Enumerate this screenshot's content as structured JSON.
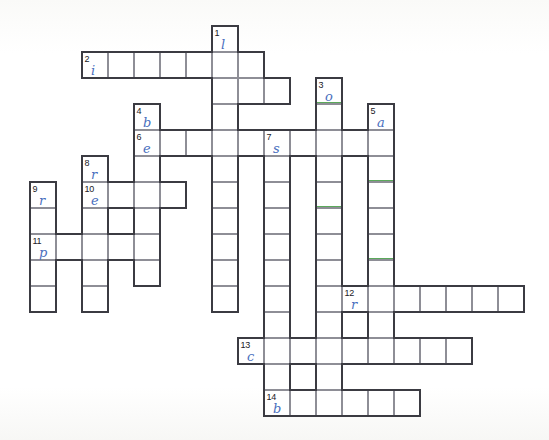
{
  "puzzle": {
    "title": "Crossword Puzzle Grid",
    "cell_size": 26,
    "origin_x": 30,
    "origin_y": 26,
    "ink_color": "#4a6fbe",
    "grid_line_color": "#8e8e96",
    "outline_color": "#3b3b42",
    "mark_color": "#5ba95b",
    "background": "#ffffff"
  },
  "entries": [
    {
      "number": "1",
      "direction": "down",
      "row": 0,
      "col": 7,
      "length": 10,
      "letter": "l"
    },
    {
      "number": "2",
      "direction": "across",
      "row": 1,
      "col": 2,
      "length": 7,
      "letter": "i"
    },
    {
      "number": "3",
      "direction": "down",
      "row": 2,
      "col": 11,
      "length": 8,
      "letter": "o"
    },
    {
      "number": "4",
      "direction": "down",
      "row": 3,
      "col": 4,
      "length": 5,
      "letter": "b"
    },
    {
      "number": "5",
      "direction": "down",
      "row": 3,
      "col": 13,
      "length": 7,
      "letter": "a"
    },
    {
      "number": "6",
      "direction": "across",
      "row": 4,
      "col": 4,
      "length": 10,
      "letter": "e"
    },
    {
      "number": "7",
      "direction": "down",
      "row": 4,
      "col": 9,
      "length": 11,
      "letter": "s"
    },
    {
      "number": "8",
      "direction": "down",
      "row": 5,
      "col": 2,
      "length": 5,
      "letter": "r"
    },
    {
      "number": "9",
      "direction": "down",
      "row": 6,
      "col": 0,
      "length": 5,
      "letter": "r"
    },
    {
      "number": "10",
      "direction": "across",
      "row": 6,
      "col": 2,
      "length": 4,
      "letter": "e"
    },
    {
      "number": "11",
      "direction": "across",
      "row": 8,
      "col": 0,
      "length": 4,
      "letter": "p"
    },
    {
      "number": "12",
      "direction": "across",
      "row": 10,
      "col": 12,
      "length": 7,
      "letter": "r"
    },
    {
      "number": "13",
      "direction": "across",
      "row": 12,
      "col": 8,
      "length": 9,
      "letter": "c"
    },
    {
      "number": "14",
      "direction": "across",
      "row": 14,
      "col": 9,
      "length": 6,
      "letter": "b"
    }
  ],
  "cells": [
    {
      "row": 0,
      "col": 7
    },
    {
      "row": 1,
      "col": 2
    },
    {
      "row": 1,
      "col": 3
    },
    {
      "row": 1,
      "col": 4
    },
    {
      "row": 1,
      "col": 5
    },
    {
      "row": 1,
      "col": 6
    },
    {
      "row": 1,
      "col": 7
    },
    {
      "row": 1,
      "col": 8
    },
    {
      "row": 2,
      "col": 7
    },
    {
      "row": 2,
      "col": 8
    },
    {
      "row": 2,
      "col": 9
    },
    {
      "row": 2,
      "col": 11
    },
    {
      "row": 3,
      "col": 4
    },
    {
      "row": 3,
      "col": 7
    },
    {
      "row": 3,
      "col": 11
    },
    {
      "row": 3,
      "col": 13
    },
    {
      "row": 4,
      "col": 4
    },
    {
      "row": 4,
      "col": 5
    },
    {
      "row": 4,
      "col": 6
    },
    {
      "row": 4,
      "col": 7
    },
    {
      "row": 4,
      "col": 8
    },
    {
      "row": 4,
      "col": 9
    },
    {
      "row": 4,
      "col": 10
    },
    {
      "row": 4,
      "col": 11
    },
    {
      "row": 4,
      "col": 12
    },
    {
      "row": 4,
      "col": 13
    },
    {
      "row": 5,
      "col": 2
    },
    {
      "row": 5,
      "col": 4
    },
    {
      "row": 5,
      "col": 7
    },
    {
      "row": 5,
      "col": 9
    },
    {
      "row": 5,
      "col": 11
    },
    {
      "row": 5,
      "col": 13
    },
    {
      "row": 6,
      "col": 0
    },
    {
      "row": 6,
      "col": 2
    },
    {
      "row": 6,
      "col": 3
    },
    {
      "row": 6,
      "col": 4
    },
    {
      "row": 6,
      "col": 5
    },
    {
      "row": 6,
      "col": 7
    },
    {
      "row": 6,
      "col": 9
    },
    {
      "row": 6,
      "col": 11
    },
    {
      "row": 6,
      "col": 13
    },
    {
      "row": 7,
      "col": 0
    },
    {
      "row": 7,
      "col": 2
    },
    {
      "row": 7,
      "col": 4
    },
    {
      "row": 7,
      "col": 7
    },
    {
      "row": 7,
      "col": 9
    },
    {
      "row": 7,
      "col": 11
    },
    {
      "row": 7,
      "col": 13
    },
    {
      "row": 8,
      "col": 0
    },
    {
      "row": 8,
      "col": 1
    },
    {
      "row": 8,
      "col": 2
    },
    {
      "row": 8,
      "col": 3
    },
    {
      "row": 8,
      "col": 4
    },
    {
      "row": 8,
      "col": 7
    },
    {
      "row": 8,
      "col": 9
    },
    {
      "row": 8,
      "col": 11
    },
    {
      "row": 8,
      "col": 13
    },
    {
      "row": 9,
      "col": 0
    },
    {
      "row": 9,
      "col": 2
    },
    {
      "row": 9,
      "col": 4
    },
    {
      "row": 9,
      "col": 7
    },
    {
      "row": 9,
      "col": 9
    },
    {
      "row": 9,
      "col": 11
    },
    {
      "row": 9,
      "col": 13
    },
    {
      "row": 10,
      "col": 0
    },
    {
      "row": 10,
      "col": 2
    },
    {
      "row": 10,
      "col": 7
    },
    {
      "row": 10,
      "col": 9
    },
    {
      "row": 10,
      "col": 11
    },
    {
      "row": 10,
      "col": 12
    },
    {
      "row": 10,
      "col": 13
    },
    {
      "row": 10,
      "col": 14
    },
    {
      "row": 10,
      "col": 15
    },
    {
      "row": 10,
      "col": 16
    },
    {
      "row": 10,
      "col": 17
    },
    {
      "row": 10,
      "col": 18
    },
    {
      "row": 11,
      "col": 9
    },
    {
      "row": 11,
      "col": 11
    },
    {
      "row": 11,
      "col": 13
    },
    {
      "row": 12,
      "col": 8
    },
    {
      "row": 12,
      "col": 9
    },
    {
      "row": 12,
      "col": 10
    },
    {
      "row": 12,
      "col": 11
    },
    {
      "row": 12,
      "col": 12
    },
    {
      "row": 12,
      "col": 13
    },
    {
      "row": 12,
      "col": 14
    },
    {
      "row": 12,
      "col": 15
    },
    {
      "row": 12,
      "col": 16
    },
    {
      "row": 13,
      "col": 9
    },
    {
      "row": 13,
      "col": 11
    },
    {
      "row": 14,
      "col": 9
    },
    {
      "row": 14,
      "col": 10
    },
    {
      "row": 14,
      "col": 11
    },
    {
      "row": 14,
      "col": 12
    },
    {
      "row": 14,
      "col": 13
    },
    {
      "row": 14,
      "col": 14
    }
  ],
  "marks": [
    {
      "row": 2,
      "col": 11
    },
    {
      "row": 6,
      "col": 11
    },
    {
      "row": 8,
      "col": 13
    },
    {
      "row": 5,
      "col": 13
    }
  ]
}
